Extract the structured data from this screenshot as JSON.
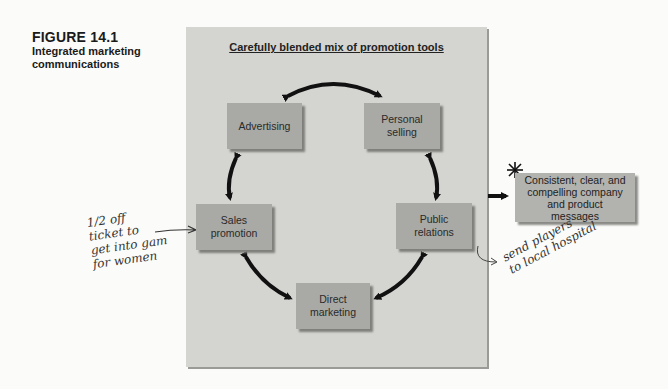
{
  "figure": {
    "number": "FIGURE 14.1",
    "caption": "Integrated marketing communications"
  },
  "panel": {
    "title": "Carefully blended mix of promotion tools",
    "tools": [
      {
        "id": "advertising",
        "label": "Advertising"
      },
      {
        "id": "personal-selling",
        "label": "Personal selling"
      },
      {
        "id": "sales-promotion",
        "label": "Sales promotion"
      },
      {
        "id": "public-relations",
        "label": "Public relations"
      },
      {
        "id": "direct-marketing",
        "label": "Direct marketing"
      }
    ]
  },
  "output": {
    "label": "Consistent, clear, and compelling company and product messages",
    "marker": "*"
  },
  "annotations": {
    "sales_promotion_note": "1/2 off\nticket to\nget into gam\nfor women",
    "public_relations_note": "send players\nto local hospital"
  },
  "colors": {
    "panel": "#d4d4d0",
    "box": "#a9a9a5",
    "arrow": "#111111"
  }
}
